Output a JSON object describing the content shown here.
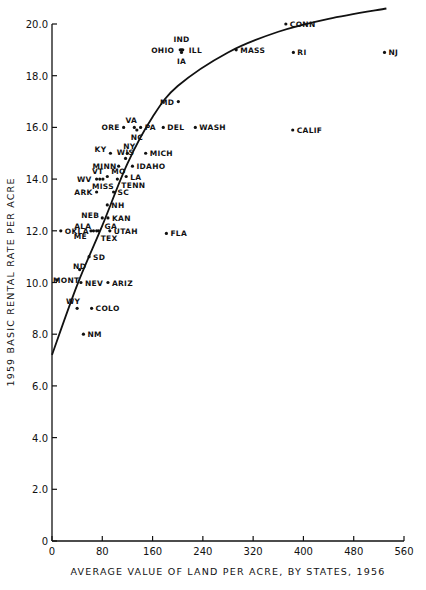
{
  "chart_data": {
    "type": "scatter",
    "title": "",
    "xlabel": "AVERAGE VALUE OF LAND PER ACRE, BY STATES, 1956",
    "ylabel": "1959 BASIC RENTAL RATE PER ACRE",
    "xlim": [
      0,
      560
    ],
    "ylim": [
      0,
      20
    ],
    "x_ticks": [
      "0",
      "80",
      "160",
      "240",
      "320",
      "400",
      "480",
      "560"
    ],
    "y_ticks": [
      "0",
      "2.0",
      "4.0",
      "6.0",
      "8.0",
      "10.0",
      "12.0",
      "14.0",
      "16.0",
      "18.0",
      "20.0"
    ],
    "grid": false,
    "legend": null,
    "points": [
      {
        "label": "IND",
        "x": 206,
        "y": 19.0
      },
      {
        "label": "OHIO",
        "x": 204,
        "y": 19.0
      },
      {
        "label": "ILL",
        "x": 208,
        "y": 19.0
      },
      {
        "label": "IA",
        "x": 206,
        "y": 18.9
      },
      {
        "label": "CONN",
        "x": 372,
        "y": 20.0
      },
      {
        "label": "MASS",
        "x": 293,
        "y": 19.0
      },
      {
        "label": "RI",
        "x": 384,
        "y": 18.9
      },
      {
        "label": "NJ",
        "x": 529,
        "y": 18.9
      },
      {
        "label": "MD",
        "x": 201,
        "y": 17.0
      },
      {
        "label": "ORE",
        "x": 114,
        "y": 16.0
      },
      {
        "label": "VA",
        "x": 131,
        "y": 16.0
      },
      {
        "label": "NC",
        "x": 135,
        "y": 15.9
      },
      {
        "label": "PA",
        "x": 141,
        "y": 16.0
      },
      {
        "label": "DEL",
        "x": 177,
        "y": 16.0
      },
      {
        "label": "WASH",
        "x": 228,
        "y": 16.0
      },
      {
        "label": "CALIF",
        "x": 383,
        "y": 15.9
      },
      {
        "label": "KY",
        "x": 93,
        "y": 15.0
      },
      {
        "label": "NY",
        "x": 120,
        "y": 15.0
      },
      {
        "label": "MICH",
        "x": 149,
        "y": 15.0
      },
      {
        "label": "WIS",
        "x": 117,
        "y": 14.8
      },
      {
        "label": "MINN",
        "x": 106,
        "y": 14.5
      },
      {
        "label": "IDAHO",
        "x": 128,
        "y": 14.5
      },
      {
        "label": "MO",
        "x": 88,
        "y": 14.1
      },
      {
        "label": "VT",
        "x": 76,
        "y": 14.0
      },
      {
        "label": "WV",
        "x": 71,
        "y": 14.0
      },
      {
        "label": "MISS",
        "x": 81,
        "y": 14.0
      },
      {
        "label": "LA",
        "x": 118,
        "y": 14.1
      },
      {
        "label": "TENN",
        "x": 104,
        "y": 14.0
      },
      {
        "label": "ARK",
        "x": 71,
        "y": 13.5
      },
      {
        "label": "SC",
        "x": 98,
        "y": 13.5
      },
      {
        "label": "NH",
        "x": 88,
        "y": 13.0
      },
      {
        "label": "NEB",
        "x": 80,
        "y": 12.5
      },
      {
        "label": "KAN",
        "x": 89,
        "y": 12.5
      },
      {
        "label": "OKLA",
        "x": 14,
        "y": 12.0
      },
      {
        "label": "ALA",
        "x": 66,
        "y": 12.0
      },
      {
        "label": "GA",
        "x": 74,
        "y": 12.0
      },
      {
        "label": "ME",
        "x": 62,
        "y": 12.0
      },
      {
        "label": "TEX",
        "x": 71,
        "y": 12.0
      },
      {
        "label": "UTAH",
        "x": 92,
        "y": 12.0
      },
      {
        "label": "FLA",
        "x": 182,
        "y": 11.9
      },
      {
        "label": "SD",
        "x": 59,
        "y": 11.0
      },
      {
        "label": "ND",
        "x": 44,
        "y": 10.5
      },
      {
        "label": "MONT",
        "x": 8,
        "y": 10.1
      },
      {
        "label": "NEV",
        "x": 46,
        "y": 10.0
      },
      {
        "label": "ARIZ",
        "x": 89,
        "y": 10.0
      },
      {
        "label": "WY",
        "x": 40,
        "y": 9.0
      },
      {
        "label": "COLO",
        "x": 63,
        "y": 9.0
      },
      {
        "label": "NM",
        "x": 50,
        "y": 8.0
      }
    ],
    "fit_curve": {
      "type": "curve",
      "points": [
        [
          0,
          7.2
        ],
        [
          40,
          9.9
        ],
        [
          80,
          12.2
        ],
        [
          120,
          14.6
        ],
        [
          160,
          16.4
        ],
        [
          200,
          17.6
        ],
        [
          280,
          18.9
        ],
        [
          360,
          19.7
        ],
        [
          440,
          20.2
        ],
        [
          532,
          20.6
        ]
      ]
    }
  }
}
